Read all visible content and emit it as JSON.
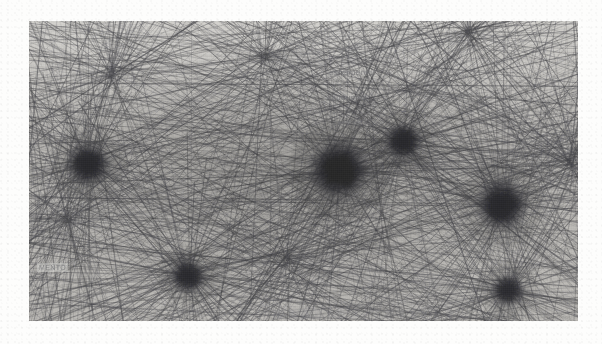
{
  "artwork": {
    "title": "Thread network installation (scanned plate)",
    "medium": "grayscale photographic scan",
    "plate": {
      "x": 29,
      "y": 21,
      "width": 549,
      "height": 300,
      "background_color": "#b9b7b3",
      "page_color": "#fdfdfc",
      "thread_color": "#4a4a4e",
      "node_color": "#2a2a2e"
    },
    "captions": {
      "top": {
        "line1": "Lentio",
        "line2": "estramento",
        "line3": "caduusmo",
        "line4": "corpore"
      },
      "left": "MENTO"
    },
    "nodes": [
      {
        "label": "node-left",
        "cx": 0.108,
        "cy": 0.478,
        "r": 12.5,
        "intensity": 0.93
      },
      {
        "label": "node-center",
        "cx": 0.565,
        "cy": 0.497,
        "r": 17.0,
        "intensity": 1.0
      },
      {
        "label": "node-upper-right",
        "cx": 0.682,
        "cy": 0.402,
        "r": 10.5,
        "intensity": 0.9
      },
      {
        "label": "node-right",
        "cx": 0.862,
        "cy": 0.613,
        "r": 14.5,
        "intensity": 0.97
      },
      {
        "label": "node-bottom-left",
        "cx": 0.29,
        "cy": 0.85,
        "r": 10.0,
        "intensity": 0.88
      },
      {
        "label": "node-bottom-right",
        "cx": 0.872,
        "cy": 0.898,
        "r": 9.5,
        "intensity": 0.86
      }
    ],
    "hubs": [
      {
        "label": "hub-upper-left",
        "cx": 0.15,
        "cy": 0.18
      },
      {
        "label": "hub-upper-mid",
        "cx": 0.43,
        "cy": 0.12
      },
      {
        "label": "hub-mid-left",
        "cx": 0.07,
        "cy": 0.66
      },
      {
        "label": "hub-lower-mid",
        "cx": 0.47,
        "cy": 0.79
      },
      {
        "label": "hub-right-edge",
        "cx": 0.985,
        "cy": 0.47
      },
      {
        "label": "hub-top-right",
        "cx": 0.8,
        "cy": 0.04
      }
    ],
    "thread_counts": {
      "long_strands": 520,
      "hub_fans": 6,
      "mesh_strands": 360
    },
    "density_label": "very high"
  }
}
